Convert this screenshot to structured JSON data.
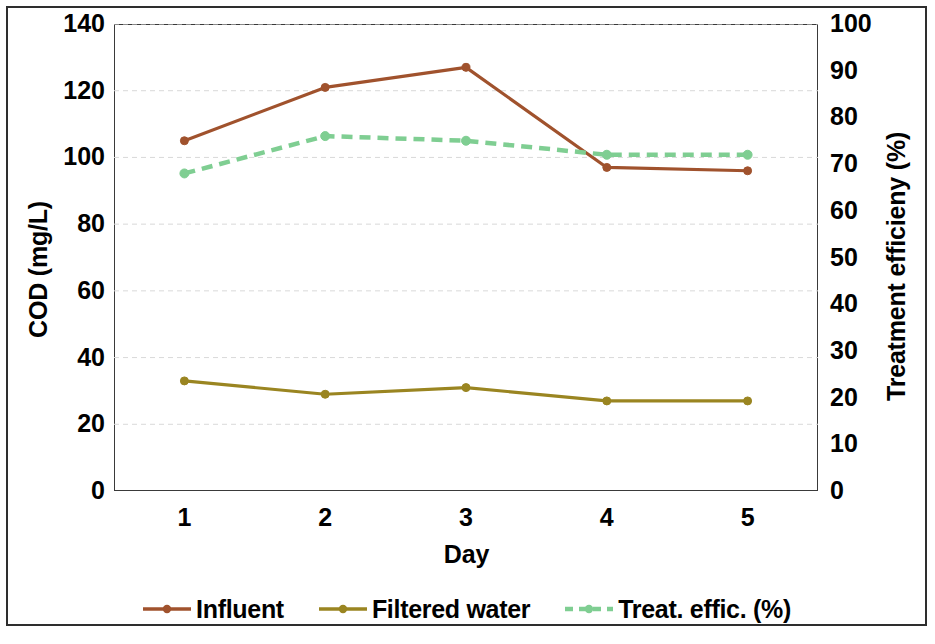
{
  "chart_data": {
    "type": "line",
    "title": "",
    "xlabel": "Day",
    "ylabel": "COD (mg/L)",
    "y2label": "Treatment efficieny (%)",
    "categories": [
      "1",
      "2",
      "3",
      "4",
      "5"
    ],
    "x": [
      1,
      2,
      3,
      4,
      5
    ],
    "xlim": [
      0.5,
      5.5
    ],
    "ylim": [
      0,
      140
    ],
    "y2lim": [
      0,
      100
    ],
    "yticks": [
      0,
      20,
      40,
      60,
      80,
      100,
      120,
      140
    ],
    "y2ticks": [
      0,
      10,
      20,
      30,
      40,
      50,
      60,
      70,
      80,
      90,
      100
    ],
    "grid": true,
    "grid_axis": "y",
    "legend_position": "bottom",
    "series": [
      {
        "name": "Influent",
        "axis": "left",
        "color": "#a0522d",
        "style": "solid",
        "marker": "circle",
        "values": [
          105,
          121,
          127,
          97,
          96
        ]
      },
      {
        "name": "Filtered water",
        "axis": "left",
        "color": "#9a8521",
        "style": "solid",
        "marker": "circle",
        "values": [
          33,
          29,
          31,
          27,
          27
        ]
      },
      {
        "name": "Treat. effic. (%)",
        "axis": "right",
        "color": "#7fce92",
        "style": "dashed",
        "marker": "circle",
        "values": [
          68,
          76,
          75,
          72,
          72
        ]
      }
    ]
  },
  "axes": {
    "left_title": "COD (mg/L)",
    "right_title": "Treatment efficieny (%)",
    "x_title": "Day",
    "left_ticks": [
      "140",
      "120",
      "100",
      "80",
      "60",
      "40",
      "20",
      "0"
    ],
    "right_ticks": [
      "100",
      "90",
      "80",
      "70",
      "60",
      "50",
      "40",
      "30",
      "20",
      "10",
      "0"
    ],
    "x_ticks": [
      "1",
      "2",
      "3",
      "4",
      "5"
    ]
  },
  "legend": {
    "items": [
      {
        "label": "Influent",
        "color": "#a0522d",
        "style": "solid"
      },
      {
        "label": "Filtered water",
        "color": "#9a8521",
        "style": "solid"
      },
      {
        "label": "Treat. effic. (%)",
        "color": "#7fce92",
        "style": "dashed"
      }
    ]
  }
}
